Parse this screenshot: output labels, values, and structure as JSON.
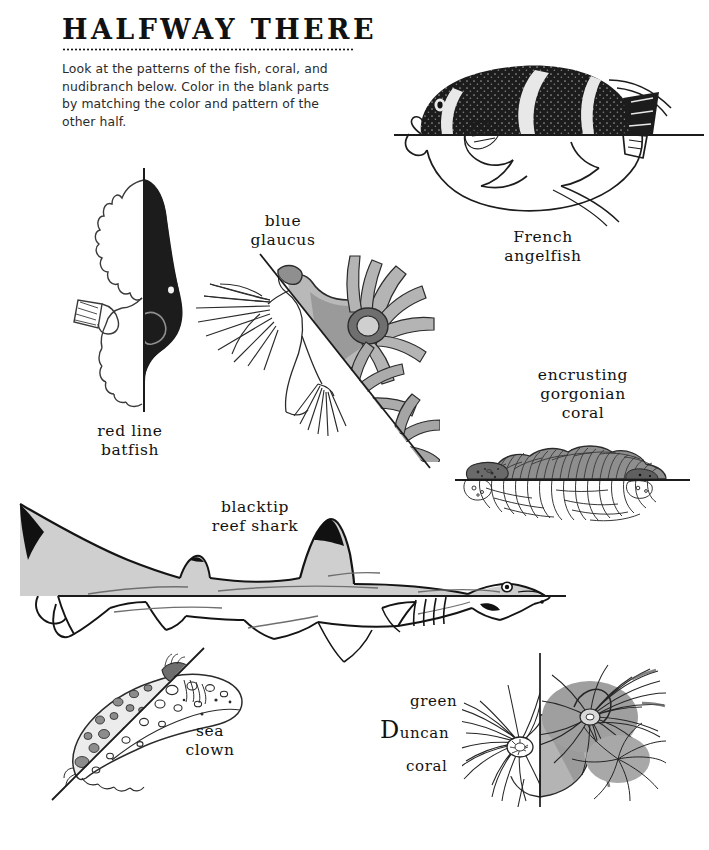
{
  "page": {
    "title": "HALFWAY THERE",
    "instructions": "Look at the patterns of the fish, coral, and nudibranch below. Color in the blank parts by matching the color and pattern of the other half.",
    "ink_color": "#111111",
    "shade_color": "#8d8d8d",
    "background_color": "#ffffff"
  },
  "figures": [
    {
      "id": "french-angelfish",
      "label": "French\nangelfish",
      "split": "horizontal",
      "shaded_half": "top"
    },
    {
      "id": "red-line-batfish",
      "label": "red line\nbatfish",
      "split": "vertical",
      "shaded_half": "right"
    },
    {
      "id": "blue-glaucus",
      "label": "blue\nglaucus",
      "split": "diagonal",
      "shaded_half": "upper-right"
    },
    {
      "id": "encrusting-gorgonian-coral",
      "label": "encrusting\ngorgonian\ncoral",
      "split": "horizontal",
      "shaded_half": "top"
    },
    {
      "id": "blacktip-reef-shark",
      "label": "blacktip\nreef shark",
      "split": "horizontal",
      "shaded_half": "top"
    },
    {
      "id": "sea-clown",
      "label": "sea\nclown",
      "split": "diagonal",
      "shaded_half": "upper-left"
    },
    {
      "id": "green-duncan-coral",
      "label_line1": "green",
      "label_line2_initial": "D",
      "label_line2_rest": "uncan",
      "label_line3": "coral",
      "split": "vertical",
      "shaded_half": "right"
    }
  ]
}
